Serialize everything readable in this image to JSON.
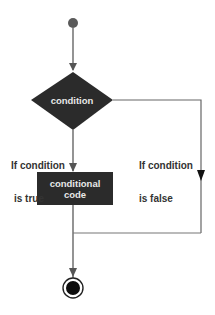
{
  "diagram": {
    "type": "flowchart",
    "nodes": {
      "start": {
        "kind": "initial-node"
      },
      "decision": {
        "label": "condition"
      },
      "action": {
        "label_line1": "conditional",
        "label_line2": "code"
      },
      "end": {
        "kind": "final-node"
      }
    },
    "edges": {
      "true_branch": {
        "label_line1": "If condition",
        "label_line2": "is true"
      },
      "false_branch": {
        "label_line1": "If condition",
        "label_line2": "is false"
      }
    },
    "colors": {
      "node_fill": "#2b2b2b",
      "line": "#666666",
      "text": "#333333",
      "node_text": "#e8e8e8",
      "start_fill": "#5a5a5a"
    }
  }
}
